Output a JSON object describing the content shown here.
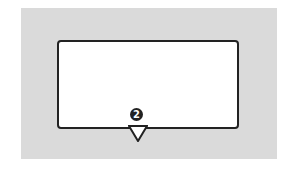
{
  "diagram": {
    "callout_number": "2",
    "colors": {
      "background_panel": "#dadada",
      "box_fill": "#ffffff",
      "outline": "#222222"
    },
    "icons": {
      "badge": "numbered-circle-badge",
      "pointer": "down-triangle-pointer"
    }
  }
}
